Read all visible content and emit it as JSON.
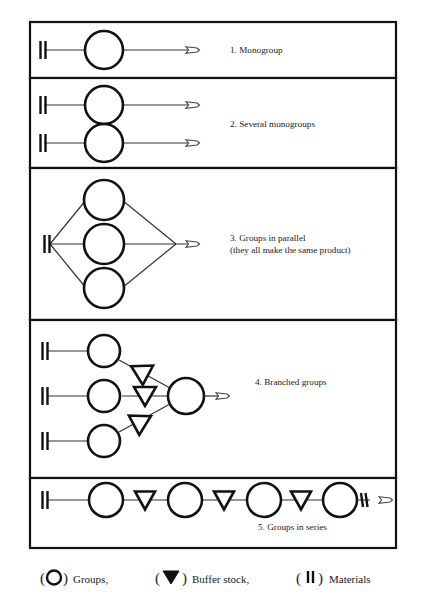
{
  "figure": {
    "background_color": "#ffffff",
    "line_color": "#111111",
    "text_color": "#1a1a1a"
  },
  "panels": [
    {
      "id": "panel-1",
      "number": "1.",
      "caption": "1. Monogroup",
      "caption_line_2": "",
      "groups_count": 1,
      "materials_count": 1,
      "buffers_count": 0,
      "outputs_count": 1,
      "topology": "single"
    },
    {
      "id": "panel-2",
      "number": "2.",
      "caption": "2. Several monogroups",
      "caption_line_2": "",
      "groups_count": 2,
      "materials_count": 2,
      "buffers_count": 0,
      "outputs_count": 2,
      "topology": "parallel-independent"
    },
    {
      "id": "panel-3",
      "number": "3.",
      "caption": "3. Groups in parallel",
      "caption_line_2": "(they all make the same product)",
      "groups_count": 3,
      "materials_count": 1,
      "buffers_count": 0,
      "outputs_count": 1,
      "topology": "parallel-converging"
    },
    {
      "id": "panel-4",
      "number": "4.",
      "caption": "4. Branched groups",
      "caption_line_2": "",
      "groups_count": 4,
      "materials_count": 3,
      "buffers_count": 3,
      "outputs_count": 1,
      "topology": "branched"
    },
    {
      "id": "panel-5",
      "number": "5.",
      "caption": "5. Groups in series",
      "caption_line_2": "",
      "groups_count": 4,
      "materials_count": 2,
      "buffers_count": 3,
      "outputs_count": 1,
      "topology": "series"
    }
  ],
  "legend": {
    "items": [
      {
        "symbol": "circle",
        "open_paren": "(",
        "close_paren": ")",
        "label": "Groups,"
      },
      {
        "symbol": "triangle-down",
        "open_paren": "(",
        "close_paren": ")",
        "label": "Buffer stock,"
      },
      {
        "symbol": "double-bar",
        "open_paren": "(",
        "close_paren": ")",
        "label": "Materials"
      }
    ]
  }
}
